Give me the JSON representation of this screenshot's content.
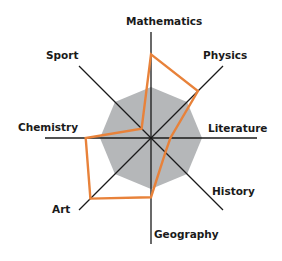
{
  "chart_data": {
    "type": "radar",
    "title": "",
    "categories": [
      "Mathematics",
      "Physics",
      "Literature",
      "History",
      "Geography",
      "Art",
      "Chemistry",
      "Sport"
    ],
    "series": [
      {
        "name": "Scores",
        "values": [
          8.2,
          6.5,
          1.9,
          2.0,
          5.8,
          8.4,
          6.4,
          1.3
        ],
        "color": "#e8823a",
        "fill": "none"
      },
      {
        "name": "Reference",
        "values": [
          5,
          5,
          5,
          5,
          5,
          5,
          5,
          5
        ],
        "color": "#b5b7b9",
        "fill": "#b5b7b9"
      }
    ],
    "rmax": 10,
    "grid": false,
    "legend": "none"
  },
  "labels": {
    "mathematics": "Mathematics",
    "physics": "Physics",
    "literature": "Literature",
    "history": "History",
    "geography": "Geography",
    "art": "Art",
    "chemistry": "Chemistry",
    "sport": "Sport"
  },
  "colors": {
    "series": "#e8823a",
    "reference": "#b5b7b9",
    "axis": "#1a1a1a"
  }
}
